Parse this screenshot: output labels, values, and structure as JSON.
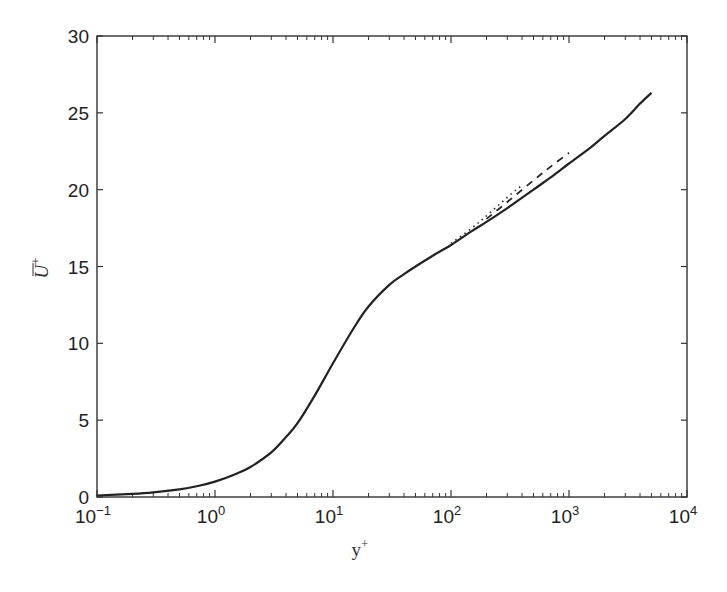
{
  "chart_data": {
    "type": "line",
    "title": "",
    "xlabel": "y+",
    "ylabel": "U+ (overbar)",
    "xscale": "log",
    "xlim": [
      0.1,
      10000
    ],
    "ylim": [
      0,
      30
    ],
    "grid": false,
    "legend": null,
    "x_ticks": [
      {
        "base": "10",
        "exp": "−1",
        "value": 0.1
      },
      {
        "base": "10",
        "exp": "0",
        "value": 1
      },
      {
        "base": "10",
        "exp": "1",
        "value": 10
      },
      {
        "base": "10",
        "exp": "2",
        "value": 100
      },
      {
        "base": "10",
        "exp": "3",
        "value": 1000
      },
      {
        "base": "10",
        "exp": "4",
        "value": 10000
      }
    ],
    "y_ticks": [
      "0",
      "5",
      "10",
      "15",
      "20",
      "25",
      "30"
    ],
    "series": [
      {
        "name": "solid",
        "style": "solid",
        "x": [
          0.1,
          0.2,
          0.3,
          0.5,
          0.7,
          1,
          1.5,
          2,
          3,
          4,
          5,
          7,
          10,
          15,
          20,
          30,
          40,
          50,
          70,
          100,
          150,
          200,
          300,
          500,
          700,
          1000,
          1500,
          2000,
          3000,
          4000,
          5000
        ],
        "values": [
          0.1,
          0.2,
          0.3,
          0.5,
          0.7,
          1.0,
          1.5,
          1.95,
          2.9,
          3.9,
          4.8,
          6.6,
          8.7,
          11.0,
          12.4,
          13.8,
          14.5,
          15.0,
          15.7,
          16.4,
          17.3,
          17.9,
          18.8,
          20.0,
          20.8,
          21.7,
          22.7,
          23.5,
          24.6,
          25.6,
          26.3
        ]
      },
      {
        "name": "dashed",
        "style": "dashed",
        "x": [
          200,
          300,
          500,
          700,
          1000
        ],
        "values": [
          18.1,
          19.2,
          20.6,
          21.5,
          22.4
        ]
      },
      {
        "name": "dotted",
        "style": "dotted",
        "x": [
          100,
          150,
          200,
          300,
          400
        ],
        "values": [
          16.5,
          17.5,
          18.3,
          19.5,
          20.3
        ]
      }
    ]
  },
  "labels": {
    "xlabel_main": "y",
    "xlabel_sup": "+",
    "ylabel_main": "U",
    "ylabel_sup": "+"
  }
}
